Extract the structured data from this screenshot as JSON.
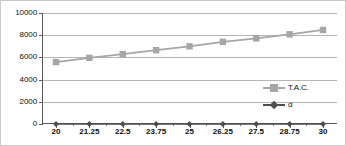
{
  "chart_data": {
    "type": "line",
    "title": "",
    "xlabel": "",
    "ylabel": "",
    "categories": [
      "20",
      "21.25",
      "22.5",
      "23.75",
      "25",
      "26.25",
      "27.5",
      "28.75",
      "30"
    ],
    "ylim": [
      0,
      10000
    ],
    "ytick_labels": [
      "10000",
      "8000",
      "6000",
      "4000",
      "2000",
      "0"
    ],
    "ytick_values": [
      10000,
      8000,
      6000,
      4000,
      2000,
      0
    ],
    "grid": true,
    "legend_position": "right-inside",
    "series": [
      {
        "name": "T.A.C.",
        "marker": "square",
        "color": "#a6a6a6",
        "values": [
          5580,
          5960,
          6290,
          6650,
          7000,
          7400,
          7720,
          8080,
          8470
        ]
      },
      {
        "name": "α",
        "marker": "diamond",
        "color": "#4d4d4d",
        "values": [
          0,
          0,
          0,
          0,
          0,
          0,
          0,
          0,
          0
        ]
      }
    ]
  },
  "legend": {
    "items": [
      {
        "label": "T.A.C."
      },
      {
        "label": "α"
      }
    ]
  },
  "colors": {
    "series_tac": "#a6a6a6",
    "series_alpha": "#4d4d4d",
    "gridline": "#b5b5b5",
    "axis": "#5a5a5a",
    "frame": "#c8c8c8",
    "text": "#0f0f0f",
    "background": "#ffffff"
  }
}
